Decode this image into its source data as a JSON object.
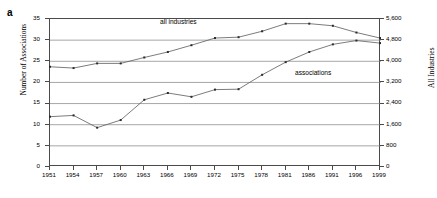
{
  "panel": {
    "label": "a"
  },
  "axes": {
    "left_title": "Number of Associations",
    "right_title": "All Industries",
    "left_ticks": [
      "0",
      "5",
      "10",
      "15",
      "20",
      "25",
      "30",
      "35"
    ],
    "right_ticks": [
      "0",
      "800",
      "1,600",
      "2,400",
      "3,200",
      "4,000",
      "4,800",
      "5,600"
    ],
    "x_ticks": [
      "1951",
      "1954",
      "1957",
      "1960",
      "1963",
      "1966",
      "1969",
      "1972",
      "1975",
      "1978",
      "1981",
      "1986",
      "1991",
      "1996",
      "1999"
    ]
  },
  "annotations": {
    "all_industries": "all industries",
    "associations": "associations"
  },
  "chart_data": {
    "type": "line",
    "title": "",
    "xlabel": "",
    "ylabel": "Number of Associations",
    "y2label": "All Industries",
    "grid": true,
    "legend": "inline-annotations",
    "x": [
      "1951",
      "1954",
      "1957",
      "1960",
      "1963",
      "1966",
      "1969",
      "1972",
      "1975",
      "1978",
      "1981",
      "1986",
      "1991",
      "1996",
      "1999"
    ],
    "ylim": [
      0,
      35
    ],
    "y2lim": [
      0,
      5600
    ],
    "series": [
      {
        "name": "associations",
        "axis": "left",
        "units": "Number of Associations",
        "values": [
          11.9,
          12.2,
          9.3,
          11.1,
          15.9,
          17.5,
          16.6,
          18.3,
          18.4,
          21.8,
          24.8,
          27.2,
          29.0,
          29.9,
          29.3
        ]
      },
      {
        "name": "all industries",
        "axis": "right",
        "units": "All Industries",
        "values_left_scale": [
          23.7,
          23.4,
          24.5,
          24.5,
          25.9,
          27.2,
          28.8,
          30.5,
          30.7,
          32.1,
          33.9,
          33.9,
          33.4,
          31.8,
          30.5
        ],
        "values": [
          3792,
          3744,
          3920,
          3920,
          4144,
          4352,
          4608,
          4880,
          4912,
          5136,
          5424,
          5424,
          5344,
          5088,
          4880
        ]
      }
    ]
  }
}
